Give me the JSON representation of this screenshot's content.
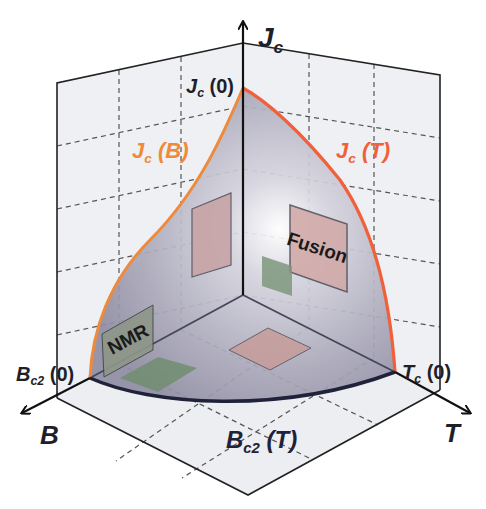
{
  "diagram": {
    "axes": {
      "vertical": {
        "label": "J",
        "sub": "c"
      },
      "left": {
        "label": "B"
      },
      "right": {
        "label": "T"
      }
    },
    "points": {
      "jc0": {
        "main": "J",
        "sub": "c",
        "tail": " (0)"
      },
      "bc20": {
        "main": "B",
        "sub": "c2",
        "tail": " (0)"
      },
      "tc0": {
        "main": "T",
        "sub": "c",
        "tail": " (0)"
      }
    },
    "curves": {
      "jcB": {
        "main": "J",
        "sub": "c",
        "tail": " (B)",
        "color": "#ee8a3a"
      },
      "jcT": {
        "main": "J",
        "sub": "c",
        "tail": " (T)",
        "color": "#f0603a"
      },
      "bc2T": {
        "main": "B",
        "sub": "c2",
        "tail": " (T)",
        "color": "#1f2238"
      }
    },
    "applications": [
      {
        "label": "Fusion",
        "color": "#c9a7a7"
      },
      {
        "label": "NMR",
        "color": "#8f9a8a"
      }
    ],
    "colors": {
      "grid": "#555555",
      "wall": "#eeeff2",
      "surface": "#b9b6c8",
      "pink_patch": "#c7a4a6",
      "green_patch": "#7f9a7e"
    }
  }
}
